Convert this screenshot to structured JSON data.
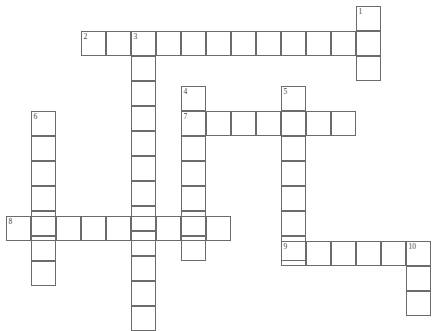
{
  "puzzle": {
    "title": "Crossword Puzzle Grid",
    "width": 443,
    "height": 331,
    "cell_size": 25,
    "border_color": "#6b6b6b",
    "background_color": "#ffffff",
    "number_color": "#444444"
  },
  "entries": [
    {
      "number": "1",
      "direction": "down",
      "length": 3,
      "start_x": 356,
      "start_y": 6,
      "label": "1-down"
    },
    {
      "number": "2",
      "direction": "across",
      "length": 12,
      "start_x": 81,
      "start_y": 31,
      "label": "2-across"
    },
    {
      "number": "3",
      "direction": "down",
      "length": 12,
      "start_x": 131,
      "start_y": 31,
      "label": "3-down"
    },
    {
      "number": "4",
      "direction": "down",
      "length": 7,
      "start_x": 181,
      "start_y": 86,
      "label": "4-down"
    },
    {
      "number": "5",
      "direction": "down",
      "length": 7,
      "start_x": 281,
      "start_y": 86,
      "label": "5-down"
    },
    {
      "number": "6",
      "direction": "down",
      "length": 7,
      "start_x": 31,
      "start_y": 111,
      "label": "6-down"
    },
    {
      "number": "7",
      "direction": "across",
      "length": 7,
      "start_x": 181,
      "start_y": 111,
      "label": "7-across"
    },
    {
      "number": "8",
      "direction": "across",
      "length": 9,
      "start_x": 6,
      "start_y": 216,
      "label": "8-across"
    },
    {
      "number": "9",
      "direction": "across",
      "length": 6,
      "start_x": 281,
      "start_y": 241,
      "label": "9-across"
    },
    {
      "number": "10",
      "direction": "down",
      "length": 3,
      "start_x": 406,
      "start_y": 241,
      "label": "10-down"
    }
  ],
  "numbered_cells": [
    {
      "number": "1",
      "x": 356,
      "y": 6
    },
    {
      "number": "2",
      "x": 81,
      "y": 31
    },
    {
      "number": "3",
      "x": 131,
      "y": 31
    },
    {
      "number": "4",
      "x": 181,
      "y": 86
    },
    {
      "number": "5",
      "x": 281,
      "y": 86
    },
    {
      "number": "6",
      "x": 31,
      "y": 111
    },
    {
      "number": "7",
      "x": 181,
      "y": 111
    },
    {
      "number": "8",
      "x": 6,
      "y": 216
    },
    {
      "number": "9",
      "x": 281,
      "y": 241
    },
    {
      "number": "10",
      "x": 406,
      "y": 241
    }
  ]
}
